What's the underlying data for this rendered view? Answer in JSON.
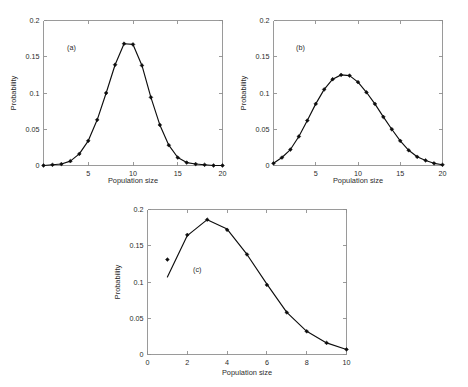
{
  "figure": {
    "background_color": "#ffffff",
    "line_color": "#0d0d0d",
    "axis_color": "#8f8f8f",
    "marker": "filled-diamond"
  },
  "chart_data": [
    {
      "type": "line",
      "title": "",
      "panel_tag": "(a)",
      "xlabel": "Population size",
      "ylabel": "Probability",
      "xlim": [
        0,
        20
      ],
      "ylim": [
        0,
        0.2
      ],
      "xticks": [
        5,
        10,
        15,
        20
      ],
      "xtick_labels": [
        "5",
        "10",
        "15",
        "20"
      ],
      "yticks": [
        0,
        0.05,
        0.1,
        0.15,
        0.2
      ],
      "ytick_labels": [
        "0",
        "0.05",
        "0.1",
        "0.15",
        "0.2"
      ],
      "grid": false,
      "legend": "none",
      "x": [
        0,
        1,
        2,
        3,
        4,
        5,
        6,
        7,
        8,
        9,
        10,
        11,
        12,
        13,
        14,
        15,
        16,
        17,
        18,
        19,
        20
      ],
      "values": [
        0.0,
        0.001,
        0.002,
        0.006,
        0.016,
        0.034,
        0.063,
        0.1,
        0.139,
        0.168,
        0.167,
        0.138,
        0.094,
        0.056,
        0.028,
        0.011,
        0.004,
        0.002,
        0.001,
        0.0,
        0.0
      ]
    },
    {
      "type": "line",
      "title": "",
      "panel_tag": "(b)",
      "xlabel": "Population size",
      "ylabel": "Probability",
      "xlim": [
        0,
        20
      ],
      "ylim": [
        0,
        0.2
      ],
      "xticks": [
        5,
        10,
        15,
        20
      ],
      "xtick_labels": [
        "5",
        "10",
        "15",
        "20"
      ],
      "yticks": [
        0,
        0.05,
        0.1,
        0.15,
        0.2
      ],
      "ytick_labels": [
        "0",
        "0.05",
        "0.1",
        "0.15",
        "0.2"
      ],
      "grid": false,
      "legend": "none",
      "x": [
        0,
        1,
        2,
        3,
        4,
        5,
        6,
        7,
        8,
        9,
        10,
        11,
        12,
        13,
        14,
        15,
        16,
        17,
        18,
        19,
        20
      ],
      "values": [
        0.003,
        0.011,
        0.022,
        0.04,
        0.062,
        0.085,
        0.105,
        0.119,
        0.125,
        0.124,
        0.115,
        0.101,
        0.085,
        0.067,
        0.05,
        0.034,
        0.021,
        0.012,
        0.007,
        0.003,
        0.001
      ]
    },
    {
      "type": "line",
      "title": "",
      "panel_tag": "(c)",
      "xlabel": "Population size",
      "ylabel": "Probability",
      "xlim": [
        0,
        10
      ],
      "ylim": [
        0,
        0.2
      ],
      "xticks": [
        0,
        2,
        4,
        6,
        8,
        10
      ],
      "xtick_labels": [
        "0",
        "2",
        "4",
        "6",
        "8",
        "10"
      ],
      "yticks": [
        0,
        0.05,
        0.1,
        0.15,
        0.2
      ],
      "ytick_labels": [
        "0",
        "0.05",
        "0.1",
        "0.15",
        "0.2"
      ],
      "grid": false,
      "legend": "none",
      "x": [
        1,
        2,
        3,
        4,
        5,
        6,
        7,
        8,
        9,
        10
      ],
      "values": [
        0.107,
        0.164,
        0.186,
        0.173,
        0.138,
        0.097,
        0.058,
        0.032,
        0.016,
        0.007
      ],
      "marker_values": [
        0.131,
        0.165,
        0.186,
        0.172,
        0.138,
        0.096,
        0.058,
        0.032,
        0.016,
        0.007
      ]
    }
  ]
}
